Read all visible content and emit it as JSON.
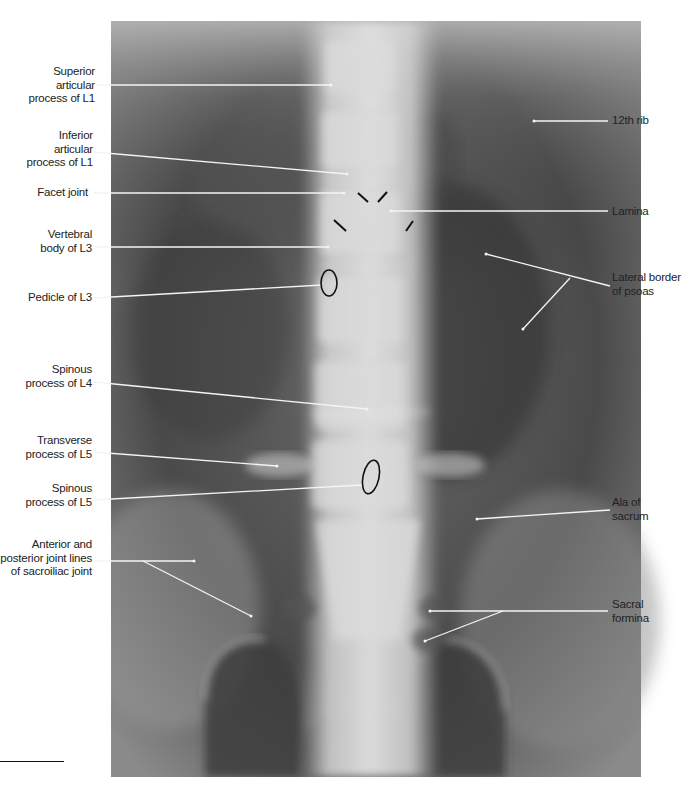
{
  "figure": {
    "type": "radiograph",
    "view": "AP lumbar spine",
    "colors": {
      "background": "#ffffff",
      "label_text": "#222222",
      "leader_line": "#f2f2f2",
      "marker": "#111111"
    }
  },
  "labels_left": [
    {
      "id": "superior-articular-process-l1",
      "lines": [
        "Superior",
        "articular",
        "process of L1"
      ]
    },
    {
      "id": "inferior-articular-process-l1",
      "lines": [
        "Inferior",
        "articular",
        "process of L1"
      ]
    },
    {
      "id": "facet-joint",
      "lines": [
        "Facet joint"
      ]
    },
    {
      "id": "vertebral-body-l3",
      "lines": [
        "Vertebral",
        "body of L3"
      ]
    },
    {
      "id": "pedicle-l3",
      "lines": [
        "Pedicle of L3"
      ]
    },
    {
      "id": "spinous-process-l4",
      "lines": [
        "Spinous",
        "process of L4"
      ]
    },
    {
      "id": "transverse-process-l5",
      "lines": [
        "Transverse",
        "process of L5"
      ]
    },
    {
      "id": "spinous-process-l5",
      "lines": [
        "Spinous",
        "process of L5"
      ]
    },
    {
      "id": "sacroiliac-joint-lines",
      "lines": [
        "Anterior and",
        "posterior joint lines",
        "of sacroiliac joint"
      ]
    }
  ],
  "labels_right": [
    {
      "id": "12th-rib",
      "lines": [
        "12th rib"
      ]
    },
    {
      "id": "lamina",
      "lines": [
        "Lamina"
      ]
    },
    {
      "id": "lateral-border-psoas",
      "lines": [
        "Lateral border",
        "of psoas"
      ]
    },
    {
      "id": "ala-of-sacrum",
      "lines": [
        "Ala of",
        "sacrum"
      ]
    },
    {
      "id": "sacral-formina",
      "lines": [
        "Sacral",
        "formina"
      ]
    }
  ]
}
